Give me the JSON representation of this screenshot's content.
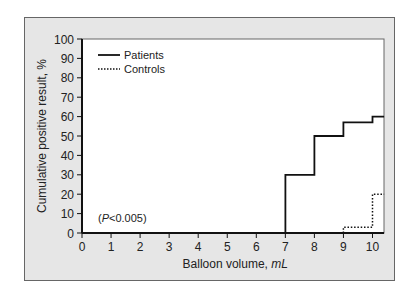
{
  "chart_data": {
    "type": "line",
    "subtype": "step",
    "title": "",
    "xlabel": "Balloon volume, mL",
    "xlabel_parts": {
      "text": "Balloon volume, ",
      "unit": "mL"
    },
    "ylabel": "Cumulative positive result, %",
    "xlim": [
      0,
      10.4
    ],
    "ylim": [
      0,
      100
    ],
    "xticks": [
      0,
      1,
      2,
      3,
      4,
      5,
      6,
      7,
      8,
      9,
      10
    ],
    "yticks": [
      0,
      10,
      20,
      30,
      40,
      50,
      60,
      70,
      80,
      90,
      100
    ],
    "grid": false,
    "legend_position": "upper left",
    "series": [
      {
        "name": "Patients",
        "style": "solid",
        "x": [
          0,
          7,
          7,
          8,
          8,
          9,
          9,
          10,
          10,
          10.4
        ],
        "y": [
          0,
          0,
          30,
          30,
          50,
          50,
          57,
          57,
          60,
          60
        ]
      },
      {
        "name": "Controls",
        "style": "dotted",
        "x": [
          0,
          9,
          9,
          10,
          10,
          10.4
        ],
        "y": [
          0,
          0,
          3,
          3,
          20,
          20
        ]
      }
    ],
    "annotations": [
      {
        "text": "(P<0.005)",
        "italic_part": "P",
        "x": 0.5,
        "y": 7
      }
    ]
  },
  "labels": {
    "ylabel": "Cumulative positive result, %",
    "xlabel_main": "Balloon volume, ",
    "xlabel_unit": "mL",
    "legend_patients": "Patients",
    "legend_controls": "Controls",
    "annot_open": "(",
    "annot_p": "P",
    "annot_rest": "<0.005)"
  },
  "colors": {
    "panel_bg": "#e6e6e6",
    "plot_bg": "#ffffff",
    "line": "#111111"
  }
}
